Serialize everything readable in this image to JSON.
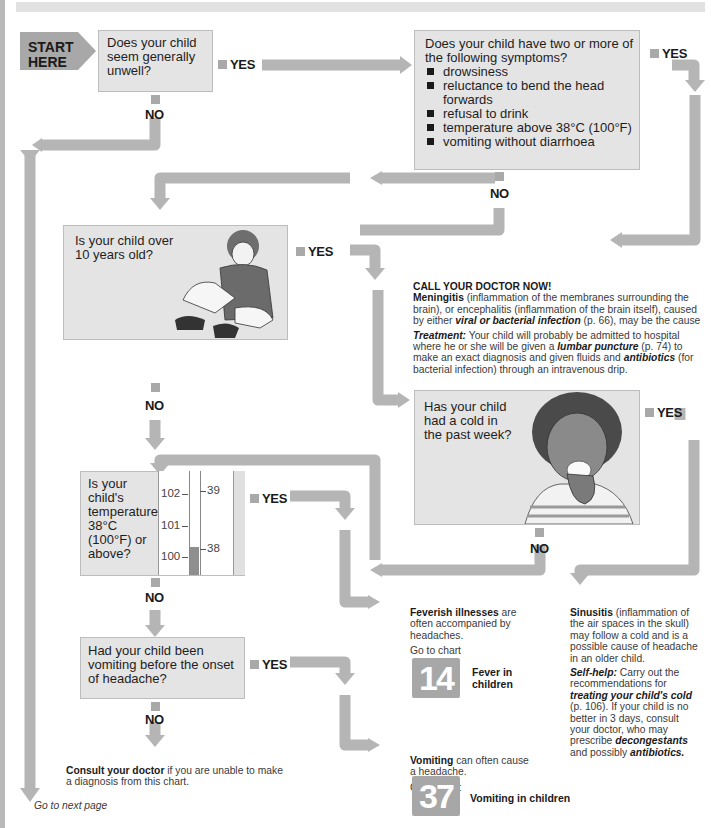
{
  "start": {
    "label_line1": "START",
    "label_line2": "HERE"
  },
  "q1": {
    "text": "Does your child seem generally unwell?",
    "yes": "YES",
    "no": "NO"
  },
  "q2": {
    "text": "Does your child have two or more of the following symptoms?",
    "symptoms": [
      "drowsiness",
      "reluctance to bend the head forwards",
      "refusal to drink",
      "temperature above 38°C (100°F)",
      "vomiting without diarrhoea"
    ],
    "yes": "YES",
    "no": "NO"
  },
  "q3": {
    "text": "Is your child over 10 years old?",
    "yes": "YES",
    "no": "NO"
  },
  "meningitis": {
    "heading": "CALL YOUR DOCTOR NOW!",
    "term": "Meningitis",
    "desc1": " (inflammation of the membranes surrounding the brain), or encephalitis (inflammation of the brain itself), caused by either ",
    "link1": "viral or bacterial infection",
    "desc2": " (p. 66), may be the cause",
    "treatment_label": "Treatment:",
    "treat1": " Your child will probably be admitted to hospital where he or she will be given a ",
    "link2": "lumbar puncture",
    "treat2": " (p. 74) to make an exact diagnosis and given fluids and ",
    "link3": "antibiotics",
    "treat3": " (for bacterial infection) through an intravenous drip."
  },
  "q4": {
    "text": "Has your child had a cold in the past week?",
    "yes": "YES",
    "no": "NO"
  },
  "q5": {
    "text": "Is your child's temperature 38°C (100°F) or above?",
    "yes": "YES",
    "no": "NO",
    "thermometer": {
      "fahrenheit": [
        "102",
        "101",
        "100"
      ],
      "celsius": [
        "39",
        "38"
      ]
    }
  },
  "q6": {
    "text": "Had your child been vomiting before the onset of headache?",
    "yes": "YES",
    "no": "NO"
  },
  "feverish": {
    "term": "Feverish illnesses",
    "desc": " are often accompanied by headaches.",
    "goto": "Go to chart",
    "chart_number": "14",
    "chart_title": "Fever in children"
  },
  "sinusitis": {
    "term": "Sinusitis",
    "desc": " (inflammation of the air spaces in the skull) may follow a cold and is a possible cause of headache in an older child.",
    "selfhelp_label": "Self-help:",
    "sh1": " Carry out the recommendations for ",
    "link1": "treating your child's cold",
    "sh2": " (p. 106). If your child is no better in 3 days, consult your doctor, who may prescribe ",
    "link2": "decongestants",
    "sh3": " and possibly ",
    "link3": "antibiotics."
  },
  "vomiting": {
    "term": "Vomiting",
    "desc": " can often cause a headache.",
    "goto": "Go to chart",
    "chart_number": "37",
    "chart_title": "Vomiting in children"
  },
  "consult": {
    "term": "Consult your doctor",
    "desc": " if you are unable to make a diagnosis from this chart."
  },
  "next_page": "Go to next page",
  "colors": {
    "arrow": "#b5b5b5",
    "box": "#e4e4e4",
    "text": "#1a1a1a"
  }
}
